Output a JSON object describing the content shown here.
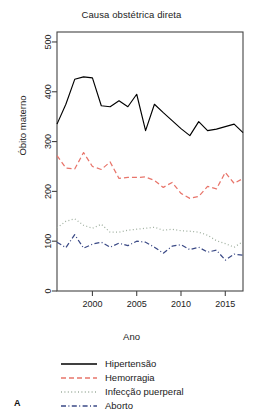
{
  "figure": {
    "panel_label": "A",
    "title": "Causa obstétrica direta",
    "xlabel": "Ano",
    "ylabel": "Óbito materno"
  },
  "legend": {
    "items": [
      {
        "label": "Hipertensão",
        "color": "#000000",
        "dash": "solid"
      },
      {
        "label": "Hemorragia",
        "color": "#E8756B",
        "dash": "dashed"
      },
      {
        "label": "Infecção puerperal",
        "color": "#9FAF9F",
        "dash": "dotted"
      },
      {
        "label": "Aborto",
        "color": "#3B4A86",
        "dash": "dashdot"
      }
    ]
  },
  "chart_data": {
    "type": "line",
    "title": "Causa obstétrica direta",
    "xlabel": "Ano",
    "ylabel": "Óbito materno",
    "xlim": [
      1996,
      2017
    ],
    "ylim": [
      0,
      520
    ],
    "yticks": [
      0,
      100,
      200,
      300,
      400,
      500
    ],
    "xticks": [
      2000,
      2005,
      2010,
      2015
    ],
    "grid": false,
    "legend_position": "bottom",
    "x": [
      1996,
      1997,
      1998,
      1999,
      2000,
      2001,
      2002,
      2003,
      2004,
      2005,
      2006,
      2007,
      2008,
      2009,
      2010,
      2011,
      2012,
      2013,
      2014,
      2015,
      2016,
      2017
    ],
    "series": [
      {
        "name": "Hipertensão",
        "color": "#000000",
        "dash": "solid",
        "values": [
          335,
          375,
          425,
          430,
          428,
          372,
          370,
          382,
          370,
          395,
          322,
          375,
          358,
          342,
          326,
          312,
          340,
          322,
          325,
          330,
          335,
          318
        ]
      },
      {
        "name": "Hemorragia",
        "color": "#E8756B",
        "dash": "dashed",
        "values": [
          272,
          247,
          245,
          278,
          250,
          244,
          259,
          226,
          228,
          228,
          229,
          222,
          208,
          218,
          196,
          186,
          190,
          210,
          205,
          238,
          216,
          226
        ]
      },
      {
        "name": "Infecção puerperal",
        "color": "#9FAF9F",
        "dash": "dotted",
        "values": [
          127,
          140,
          145,
          132,
          126,
          134,
          118,
          118,
          122,
          124,
          126,
          128,
          122,
          124,
          121,
          120,
          118,
          112,
          101,
          95,
          88,
          99
        ]
      },
      {
        "name": "Aborto",
        "color": "#3B4A86",
        "dash": "dashdot",
        "values": [
          98,
          87,
          113,
          86,
          94,
          98,
          88,
          96,
          91,
          100,
          98,
          88,
          76,
          90,
          93,
          83,
          88,
          78,
          82,
          62,
          74,
          72
        ]
      }
    ]
  }
}
